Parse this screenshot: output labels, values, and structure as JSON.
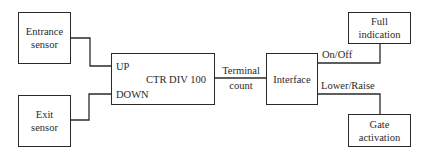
{
  "diagram": {
    "type": "block-diagram",
    "blocks": {
      "entrance_sensor": {
        "line1": "Entrance",
        "line2": "sensor"
      },
      "exit_sensor": {
        "line1": "Exit",
        "line2": "sensor"
      },
      "counter": {
        "title": "CTR DIV 100",
        "input_up": "UP",
        "input_down": "DOWN"
      },
      "interface": {
        "title": "Interface"
      },
      "full_indication": {
        "line1": "Full",
        "line2": "indication"
      },
      "gate_activation": {
        "line1": "Gate",
        "line2": "activation"
      }
    },
    "connections": {
      "terminal_count": {
        "line1": "Terminal",
        "line2": "count"
      },
      "on_off": "On/Off",
      "lower_raise": "Lower/Raise"
    }
  }
}
